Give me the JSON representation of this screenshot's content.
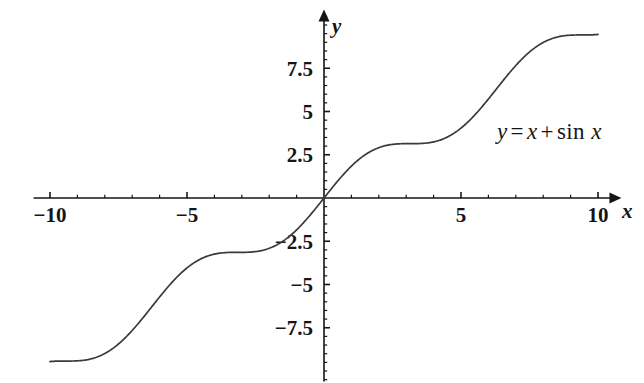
{
  "chart_data": {
    "type": "line",
    "title": "",
    "subtitle": "",
    "xlabel": "x",
    "ylabel": "y",
    "xlim": [
      -10.6,
      10.6
    ],
    "ylim": [
      -10.6,
      10.6
    ],
    "grid": false,
    "legend": "none",
    "annotations": [
      {
        "name": "equation-label",
        "text": "y = x + sin x",
        "parts": {
          "lhs": "y",
          "equals": "=",
          "rhs_var": "x",
          "plus": "+",
          "fn": "sin",
          "arg": "x"
        },
        "x": 7.2,
        "y": 4.0
      }
    ],
    "axes": {
      "x": {
        "major_ticks": [
          -10,
          -5,
          5,
          10
        ],
        "major_tick_labels": [
          "−10",
          "−5",
          "5",
          "10"
        ],
        "minor_tick_step": 1,
        "arrow": "right",
        "label": "x"
      },
      "y": {
        "major_ticks": [
          7.5,
          5,
          2.5,
          -2.5,
          -5,
          -7.5
        ],
        "major_tick_labels": [
          "7.5",
          "5",
          "2.5",
          "−2.5",
          "−5",
          "−7.5"
        ],
        "minor_tick_step": 0.5,
        "arrow": "up",
        "label": "y"
      }
    },
    "series": [
      {
        "name": "y = x + sin x",
        "color": "#3a3a3a",
        "linewidth": 1.7,
        "x": [
          -10,
          -9.75,
          -9.5,
          -9.25,
          -9,
          -8.75,
          -8.5,
          -8.25,
          -8,
          -7.75,
          -7.5,
          -7.25,
          -7,
          -6.75,
          -6.5,
          -6.25,
          -6,
          -5.75,
          -5.5,
          -5.25,
          -5,
          -4.75,
          -4.5,
          -4.25,
          -4,
          -3.75,
          -3.5,
          -3.25,
          -3,
          -2.75,
          -2.5,
          -2.25,
          -2,
          -1.75,
          -1.5,
          -1.25,
          -1,
          -0.75,
          -0.5,
          -0.25,
          0,
          0.25,
          0.5,
          0.75,
          1,
          1.25,
          1.5,
          1.75,
          2,
          2.25,
          2.5,
          2.75,
          3,
          3.25,
          3.5,
          3.75,
          4,
          4.25,
          4.5,
          4.75,
          5,
          5.25,
          5.5,
          5.75,
          6,
          6.25,
          6.5,
          6.75,
          7,
          7.25,
          7.5,
          7.75,
          8,
          8.25,
          8.5,
          8.75,
          9,
          9.25,
          9.5,
          9.75,
          10
        ],
        "y": [
          -9.456,
          -9.36,
          -9.425,
          -9.64,
          -9.588,
          -9.271,
          -8.702,
          -8.304,
          -8.011,
          -8.717,
          -8.437,
          -8.056,
          -7.657,
          -7.316,
          -7.715,
          -7.217,
          -6.721,
          -6.26,
          -6.206,
          -6.109,
          -5.041,
          -4.751,
          -4.522,
          -4.357,
          -4.257,
          -4.221,
          -4.249,
          -4.342,
          -3.859,
          -3.368,
          -2.901,
          -2.472,
          -2.091,
          -1.766,
          -1.503,
          -1.301,
          -1.159,
          -1.068,
          -1.021,
          -1.007,
          0,
          0.497,
          0.979,
          1.432,
          1.841,
          2.199,
          2.497,
          2.734,
          2.909,
          3.028,
          3.098,
          3.131,
          3.141,
          3.142,
          3.149,
          3.178,
          3.243,
          3.356,
          3.523,
          3.749,
          4.041,
          4.389,
          4.793,
          5.243,
          5.721,
          6.221,
          6.715,
          7.195,
          7.657,
          8.093,
          8.563,
          8.736,
          9.011,
          9.137,
          9.701,
          9.518,
          9.588,
          9.444,
          9.413,
          9.392,
          9.456
        ]
      }
    ]
  },
  "figure": {
    "background": "#ffffff",
    "curve_color": "#3a3a3a",
    "axis_color": "#151515",
    "text_color": "#151515"
  }
}
